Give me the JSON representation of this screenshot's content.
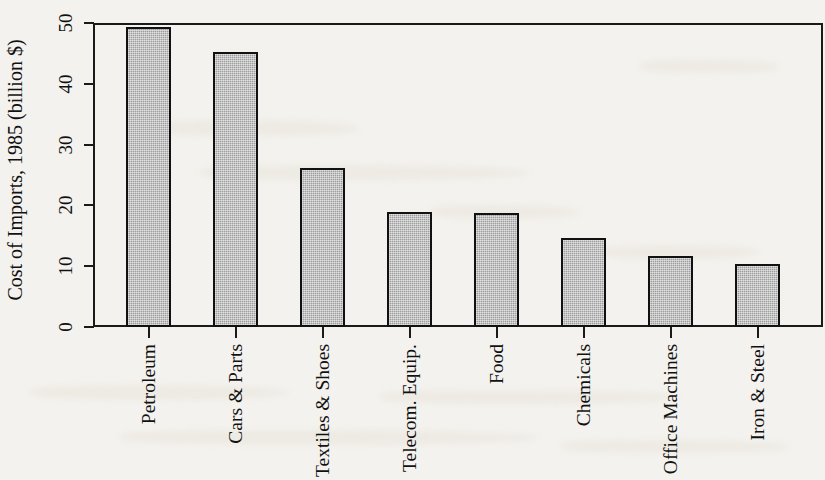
{
  "chart_data": {
    "type": "bar",
    "title": "",
    "xlabel": "",
    "ylabel": "Cost of Imports, 1985 (billion $)",
    "categories": [
      "Petroleum",
      "Cars & Parts",
      "Textiles & Shoes",
      "Telecom. Equip.",
      "Food",
      "Chemicals",
      "Office Machines",
      "Iron & Steel"
    ],
    "values": [
      49.3,
      45.2,
      26.1,
      18.9,
      18.8,
      14.7,
      11.7,
      10.4
    ],
    "ylim": [
      0,
      50
    ],
    "yticks": [
      0,
      10,
      20,
      30,
      40,
      50
    ],
    "ytick_labels": [
      "0",
      "10",
      "20",
      "30",
      "40",
      "50"
    ],
    "grid": false,
    "legend": false,
    "bar_fill_color": "#9d9d9d",
    "bar_edge_color": "#111111",
    "background_color": "#f4f2ee",
    "axis_color": "#1a1a1a"
  }
}
